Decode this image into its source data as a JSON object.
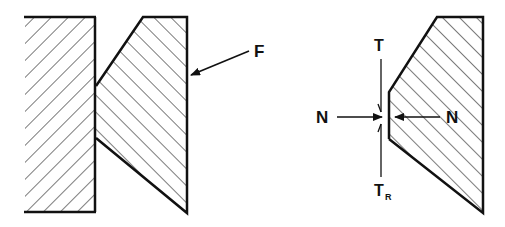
{
  "diagram": {
    "left_figure": {
      "description": "Two hatched bodies in contact; right body wedge pressed against left block",
      "force_label": "F"
    },
    "right_figure": {
      "description": "Free body of wedge contact showing normal and tangential forces",
      "labels": {
        "top_tangent": "T",
        "bottom_tangent_main": "T",
        "bottom_tangent_sub": "R",
        "normal_left": "N",
        "normal_right": "N"
      }
    },
    "colors": {
      "ink": "#111111",
      "background": "#ffffff"
    }
  }
}
